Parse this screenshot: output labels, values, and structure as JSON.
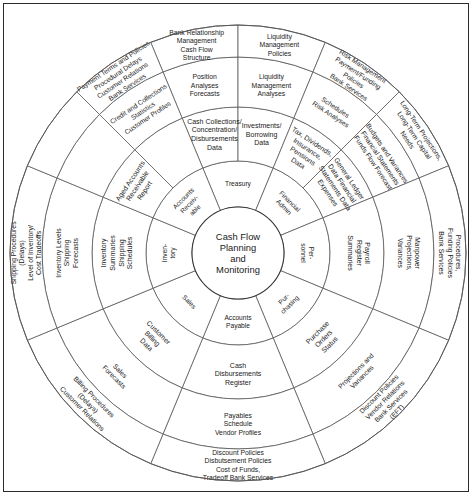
{
  "diagram": {
    "center": {
      "lines": [
        "Cash Flow",
        "Planning",
        "and",
        "Monitoring"
      ]
    },
    "geometry": {
      "cx": 237,
      "cy": 252,
      "r_hub": 46,
      "r_ring1": 92,
      "r_ring2": 146,
      "r_ring3": 196,
      "r_outer": 228,
      "sector_count": 8,
      "start_angle_deg": -112.5
    },
    "colors": {
      "background": "#ffffff",
      "stroke": "#5a5a5a",
      "frame": "#2b2b2b",
      "text": "#1a1a1a"
    },
    "sectors": [
      {
        "name": "treasury",
        "ring1": [
          "Treasury"
        ],
        "sub": [
          {
            "ring2": [
              "Cash Collections/",
              "Concentration/",
              "Disbursements",
              "Data"
            ],
            "ring3": [
              "Position",
              "Analyses",
              "Forecasts"
            ],
            "ring4": [
              "Bank Relationship",
              "Management",
              "Cash Flow",
              "Structure"
            ]
          },
          {
            "ring2": [
              "Investments/",
              "Borrowing",
              "Data"
            ],
            "ring3": [
              "Liquidity",
              "Management",
              "Analyses"
            ],
            "ring4": [
              "Liquidity",
              "Management",
              "Policies"
            ]
          }
        ]
      },
      {
        "name": "financial-admin",
        "ring1": [
          "Financial",
          "Admin"
        ],
        "sub": [
          {
            "ring2": [
              "Tax, Dividends,",
              "Insurance,",
              "Pensions",
              "Data"
            ],
            "ring3": [
              "Schedules",
              "Risk Analyses"
            ],
            "ring4": [
              "Risk Management",
              "Payment/Funding",
              "Policies",
              "Bank Services"
            ]
          },
          {
            "ring2": [
              "General Ledger",
              "Data Financial",
              "Statements Data",
              "Expenses"
            ],
            "ring3": [
              "Budgets and Variances",
              "Financial Statements",
              "Funds Flow Forecast"
            ],
            "ring4": [
              "Long-Term Projections,",
              "Long-Term Capital",
              "Needs"
            ]
          }
        ]
      },
      {
        "name": "personnel",
        "ring1": [
          "Per-",
          "sonnel"
        ],
        "sub": [
          {
            "ring2": [
              "Payroll",
              "Register",
              "Summaries"
            ],
            "ring3": [
              "Manpower",
              "Projections,",
              "Variances"
            ],
            "ring4": [
              "Procedures,",
              "Funding Policies",
              "Bank Services"
            ]
          }
        ]
      },
      {
        "name": "purchasing",
        "ring1": [
          "Pur-",
          "chasing"
        ],
        "sub": [
          {
            "ring2": [
              "Purchase",
              "Orders",
              "Status"
            ],
            "ring3": [
              "Projections and",
              "Variances"
            ],
            "ring4": [
              "Discount Policies",
              "Vendor Relations",
              "Bank Services",
              "(EFT)"
            ]
          }
        ]
      },
      {
        "name": "accounts-payable",
        "ring1": [
          "Accounts",
          "Payable"
        ],
        "sub": [
          {
            "ring2": [
              "Cash",
              "Disbursements",
              "Register"
            ],
            "ring3": [
              "Payables",
              "Schedule",
              "Vendor Profiles"
            ],
            "ring4": [
              "Discount Policies",
              "Disbutsement Policies",
              "Cost of Funds,",
              "Tradeoff Bank Services"
            ]
          }
        ]
      },
      {
        "name": "sales",
        "ring1": [
          "Sales"
        ],
        "sub": [
          {
            "ring2": [
              "Customer",
              "Billing",
              "Data"
            ],
            "ring3": [
              "Sales",
              "Forecasts"
            ],
            "ring4": [
              "Billing Procedures",
              "(Delays)",
              "Customer Relations"
            ]
          }
        ]
      },
      {
        "name": "inventory",
        "ring1": [
          "Inven-",
          "tory"
        ],
        "sub": [
          {
            "ring2": [
              "Inventory",
              "Summaries",
              "Shipping",
              "Schedules"
            ],
            "ring3": [
              "Inventory Levels",
              "Shipping",
              "Forecasts"
            ],
            "ring4": [
              "Shipping Procedures",
              "(Delays)",
              "Level of Inventory/",
              "Cost Tradeoffs"
            ]
          }
        ]
      },
      {
        "name": "accounts-receivable",
        "ring1": [
          "Accounts",
          "Receiv-",
          "able"
        ],
        "sub": [
          {
            "ring2": [
              "Aged Accounts",
              "Receivable",
              "Report"
            ],
            "ring3": [],
            "ring4": []
          },
          {
            "ring2": [],
            "ring3": [
              "Credit and Collections",
              "Statistics",
              "Customer Profiles"
            ],
            "ring4": [
              "Payment Terms and Policies",
              "Procedural Delays",
              "Customer Relations",
              "Bank Services"
            ]
          }
        ]
      }
    ]
  }
}
